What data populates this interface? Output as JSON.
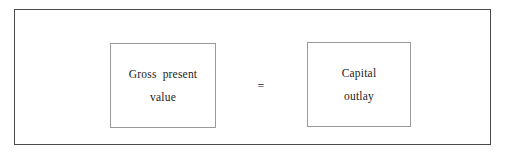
{
  "figure": {
    "type": "equation-diagram",
    "background_color": "#ffffff",
    "frame_border_color": "#4a4a4a",
    "box_border_color": "#9a9a9a",
    "text_color": "#1c1c1c",
    "operator": "=",
    "terms": [
      {
        "name": "gross-present-value",
        "lines": [
          "Gross present",
          "value"
        ]
      },
      {
        "name": "capital-outlay",
        "lines": [
          "Capital",
          "outlay"
        ]
      }
    ]
  }
}
